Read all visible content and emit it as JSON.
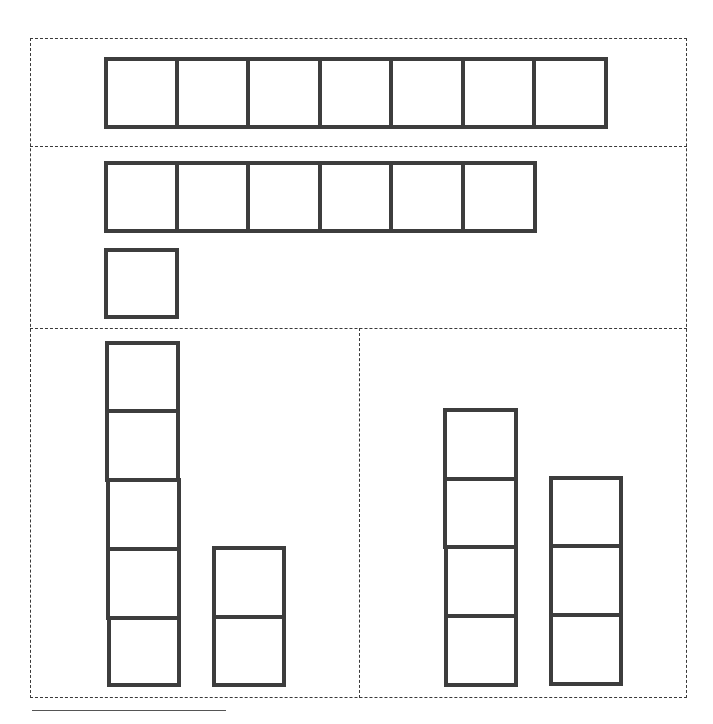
{
  "diagram": {
    "colors": {
      "block_stroke": "#3d3d3d",
      "dashed_border": "#3a3a3a",
      "background": "#ffffff"
    },
    "sections": [
      {
        "id": "row-1",
        "groups": [
          {
            "name": "seven-blocks",
            "count": 7,
            "orientation": "horizontal"
          }
        ]
      },
      {
        "id": "row-2",
        "groups": [
          {
            "name": "six-blocks",
            "count": 6,
            "orientation": "horizontal"
          },
          {
            "name": "one-block",
            "count": 1,
            "orientation": "horizontal"
          }
        ]
      },
      {
        "id": "row-3-left",
        "groups": [
          {
            "name": "five-blocks",
            "count": 5,
            "orientation": "vertical"
          },
          {
            "name": "two-blocks",
            "count": 2,
            "orientation": "vertical"
          }
        ]
      },
      {
        "id": "row-3-right",
        "groups": [
          {
            "name": "four-blocks",
            "count": 4,
            "orientation": "vertical"
          },
          {
            "name": "three-blocks",
            "count": 3,
            "orientation": "vertical"
          }
        ]
      }
    ]
  }
}
